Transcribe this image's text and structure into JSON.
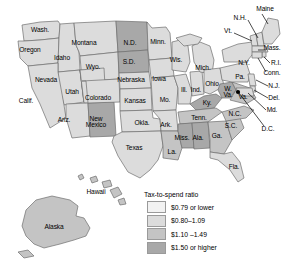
{
  "map": {
    "title": "United States tax-to-spend ratio by state",
    "projection_note": "lower 48 with Alaska and Hawaii insets"
  },
  "legend": {
    "title": "Tax-to-spend ratio",
    "entries": [
      {
        "label": "$0.79 or lower",
        "color": "#f2f2f2",
        "class": "c1"
      },
      {
        "label": "$0.80–1.09",
        "color": "#dcdcdc",
        "class": "c2"
      },
      {
        "label": "$1.10 –1.49",
        "color": "#c4c4c4",
        "class": "c3"
      },
      {
        "label": "$1.50 or higher",
        "color": "#a8a8a8",
        "class": "c4"
      }
    ]
  },
  "palette": {
    "c1": "#f2f2f2",
    "c2": "#dcdcdc",
    "c3": "#c4c4c4",
    "c4": "#a8a8a8",
    "stroke": "#6e6e6e",
    "label": "#000000",
    "leader": "#000000"
  },
  "states": [
    {
      "code": "WA",
      "label": "Wash.",
      "x": 40,
      "y": 30,
      "tier": "c2"
    },
    {
      "code": "OR",
      "label": "Oregon",
      "x": 30,
      "y": 50,
      "tier": "c2"
    },
    {
      "code": "ID",
      "label": "Idaho",
      "x": 62,
      "y": 58,
      "tier": "c2"
    },
    {
      "code": "MT",
      "label": "Montana",
      "x": 84,
      "y": 43,
      "tier": "c2"
    },
    {
      "code": "WY",
      "label": "Wyo.",
      "x": 93,
      "y": 67,
      "tier": "c2"
    },
    {
      "code": "NV",
      "label": "Nevada",
      "x": 46,
      "y": 80,
      "tier": "c2"
    },
    {
      "code": "UT",
      "label": "Utah",
      "x": 72,
      "y": 92,
      "tier": "c2"
    },
    {
      "code": "CA",
      "label": "Calif.",
      "x": 26,
      "y": 101,
      "tier": "c2"
    },
    {
      "code": "AZ",
      "label": "Ariz.",
      "x": 64,
      "y": 120,
      "tier": "c2"
    },
    {
      "code": "NM",
      "label": "New\nMexico",
      "x": 96,
      "y": 122,
      "tier": "c4"
    },
    {
      "code": "CO",
      "label": "Colorado",
      "x": 98,
      "y": 98,
      "tier": "c2"
    },
    {
      "code": "ND",
      "label": "N.D.",
      "x": 130,
      "y": 43,
      "tier": "c4"
    },
    {
      "code": "SD",
      "label": "S.D.",
      "x": 129,
      "y": 62,
      "tier": "c4"
    },
    {
      "code": "NE",
      "label": "Nebraska",
      "x": 131,
      "y": 80,
      "tier": "c2"
    },
    {
      "code": "KS",
      "label": "Kansas",
      "x": 135,
      "y": 101,
      "tier": "c2"
    },
    {
      "code": "OK",
      "label": "Okla.",
      "x": 142,
      "y": 123,
      "tier": "c2"
    },
    {
      "code": "TX",
      "label": "Texas",
      "x": 134,
      "y": 148,
      "tier": "c2"
    },
    {
      "code": "MN",
      "label": "Minn.",
      "x": 158,
      "y": 42,
      "tier": "c2"
    },
    {
      "code": "IA",
      "label": "Iowa",
      "x": 159,
      "y": 79,
      "tier": "c2"
    },
    {
      "code": "MO",
      "label": "Mo.",
      "x": 165,
      "y": 100,
      "tier": "c2"
    },
    {
      "code": "AR",
      "label": "Ark.",
      "x": 166,
      "y": 125,
      "tier": "c2"
    },
    {
      "code": "LA",
      "label": "La.",
      "x": 172,
      "y": 152,
      "tier": "c3"
    },
    {
      "code": "WI",
      "label": "Wis.",
      "x": 176,
      "y": 60,
      "tier": "c2"
    },
    {
      "code": "IL",
      "label": "Ill.",
      "x": 184,
      "y": 90,
      "tier": "c2"
    },
    {
      "code": "IN",
      "label": "Ind.",
      "x": 196,
      "y": 90,
      "tier": "c2"
    },
    {
      "code": "MI",
      "label": "Mich.",
      "x": 203,
      "y": 68,
      "tier": "c2"
    },
    {
      "code": "OH",
      "label": "Ohio",
      "x": 212,
      "y": 84,
      "tier": "c2"
    },
    {
      "code": "KY",
      "label": "Ky.",
      "x": 207,
      "y": 103,
      "tier": "c4"
    },
    {
      "code": "TN",
      "label": "Tenn.",
      "x": 199,
      "y": 118,
      "tier": "c3"
    },
    {
      "code": "MS",
      "label": "Miss.",
      "x": 182,
      "y": 138,
      "tier": "c4"
    },
    {
      "code": "AL",
      "label": "Ala.",
      "x": 198,
      "y": 138,
      "tier": "c4"
    },
    {
      "code": "GA",
      "label": "Ga.",
      "x": 217,
      "y": 136,
      "tier": "c3"
    },
    {
      "code": "FL",
      "label": "Fla.",
      "x": 234,
      "y": 167,
      "tier": "c2"
    },
    {
      "code": "SC",
      "label": "S.C.",
      "x": 231,
      "y": 126,
      "tier": "c3"
    },
    {
      "code": "NC",
      "label": "N.C.",
      "x": 235,
      "y": 114,
      "tier": "c3"
    },
    {
      "code": "WV",
      "label": "W.\nVa.",
      "x": 228,
      "y": 92,
      "tier": "c4"
    },
    {
      "code": "VA",
      "label": "Va.",
      "x": 243,
      "y": 97,
      "tier": "c3"
    },
    {
      "code": "PA",
      "label": "Pa.",
      "x": 240,
      "y": 77,
      "tier": "c2"
    },
    {
      "code": "NY",
      "label": "N.Y.",
      "x": 244,
      "y": 63,
      "tier": "c2"
    },
    {
      "code": "AK",
      "label": "Alaska",
      "x": 54,
      "y": 227,
      "tier": "c3"
    },
    {
      "code": "HI",
      "label": "Hawaii",
      "x": 96,
      "y": 192,
      "tier": "c3"
    }
  ],
  "callouts": [
    {
      "code": "ME",
      "label": "Maine",
      "x": 265,
      "y": 9,
      "tier": "c2"
    },
    {
      "code": "NH",
      "label": "N.H.",
      "x": 240,
      "y": 18,
      "tier": "c2"
    },
    {
      "code": "VT",
      "label": "Vt.",
      "x": 228,
      "y": 31,
      "tier": "c2"
    },
    {
      "code": "MA",
      "label": "Mass.",
      "x": 272,
      "y": 48,
      "tier": "c2"
    },
    {
      "code": "RI",
      "label": "R.I.",
      "x": 276,
      "y": 63,
      "tier": "c2"
    },
    {
      "code": "CT",
      "label": "Conn.",
      "x": 272,
      "y": 73,
      "tier": "c2"
    },
    {
      "code": "NJ",
      "label": "N.J.",
      "x": 274,
      "y": 86,
      "tier": "c2"
    },
    {
      "code": "DE",
      "label": "Del.",
      "x": 274,
      "y": 98,
      "tier": "c2"
    },
    {
      "code": "MD",
      "label": "Md.",
      "x": 272,
      "y": 110,
      "tier": "c2"
    },
    {
      "code": "DC",
      "label": "D.C.",
      "x": 268,
      "y": 129,
      "tier": "c4"
    }
  ]
}
